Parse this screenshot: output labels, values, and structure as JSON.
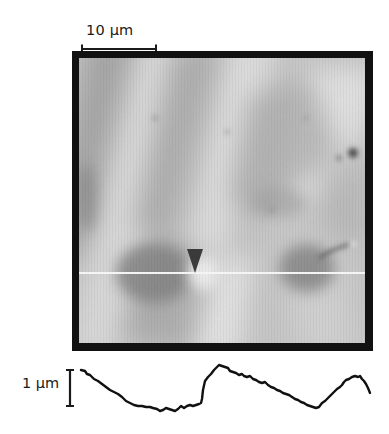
{
  "figure": {
    "scale_bar_horizontal": {
      "label": "10 µm",
      "length_um": 10
    },
    "scale_bar_vertical": {
      "label": "1 µm",
      "length_um": 1
    },
    "afm_image": {
      "description": "Grayscale AFM topography image with diagonal ridges and troughs",
      "scan_line": {
        "color": "#f4f4f4",
        "y_fraction": 0.78
      },
      "marker": {
        "shape": "down-triangle",
        "color": "#3a3a3a",
        "x_fraction": 0.43
      }
    },
    "height_profile": {
      "description": "Height profile along the white scan line",
      "line_color": "#111111"
    }
  },
  "colors": {
    "frame": "#111111",
    "background": "#ffffff",
    "text": "#1a1a1a"
  }
}
